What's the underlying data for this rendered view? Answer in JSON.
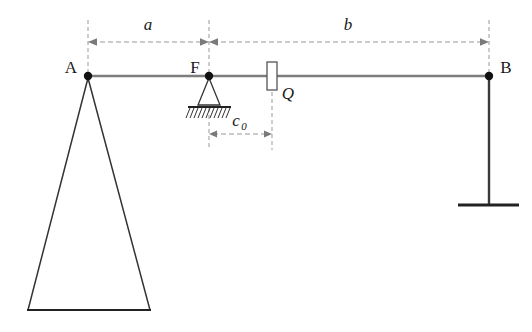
{
  "figure": {
    "type": "statics-beam-diagram",
    "background_color": "#ffffff",
    "points": {
      "A": {
        "label": "A",
        "x": 88,
        "y": 76
      },
      "F": {
        "label": "F",
        "x": 209,
        "y": 76
      },
      "B": {
        "label": "B",
        "x": 489,
        "y": 76
      }
    },
    "load": {
      "label": "Q",
      "x": 272,
      "y": 76,
      "block_width": 10,
      "block_height": 28
    },
    "dimensions": [
      {
        "name": "a",
        "label": "a",
        "from_x": 88,
        "to_x": 209,
        "y": 42,
        "label_x": 148,
        "label_y": 30
      },
      {
        "name": "b",
        "label": "b",
        "from_x": 209,
        "to_x": 489,
        "y": 42,
        "label_x": 348,
        "label_y": 30
      },
      {
        "name": "c0",
        "label": "c",
        "subscript": "0",
        "from_x": 209,
        "to_x": 272,
        "y": 134,
        "label_x": 242,
        "label_y": 124
      }
    ],
    "supports": {
      "A": {
        "kind": "triangle-knife-edge",
        "apex_x": 88,
        "apex_y": 78,
        "base_left_x": 28,
        "base_right_x": 150,
        "base_y": 310
      },
      "F": {
        "kind": "pinned-hatched-ground",
        "apex_x": 209,
        "apex_y": 78,
        "base_left_x": 192,
        "base_right_x": 227,
        "base_y": 107,
        "hatch_count": 11
      },
      "B": {
        "kind": "column-with-baseplate",
        "column_x": 489,
        "top_y": 78,
        "base_y": 205,
        "plate_left_x": 458,
        "plate_right_x": 519
      }
    },
    "beam": {
      "from_x": 88,
      "to_x": 489,
      "y": 76,
      "color": "#808080"
    },
    "colors": {
      "line": "#333333",
      "beam": "#7d7d7d",
      "dashed": "#999999",
      "node": "#111111",
      "text": "#1a1a1a"
    }
  }
}
